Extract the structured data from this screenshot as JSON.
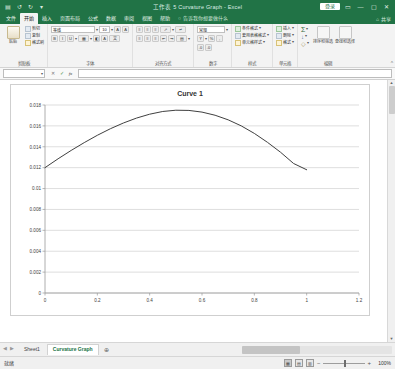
{
  "window": {
    "title": "工作表 5 Curvature Graph  -  Excel",
    "signin_label": "登录",
    "quick_access": [
      "save-icon",
      "undo-icon",
      "redo-icon",
      "customize-icon"
    ],
    "controls": {
      "ribbon_display": "▭",
      "minimize": "―",
      "maximize": "▢",
      "close": "✕"
    }
  },
  "ribbon": {
    "tabs": [
      {
        "label": "文件",
        "active": false
      },
      {
        "label": "开始",
        "active": true
      },
      {
        "label": "插入",
        "active": false
      },
      {
        "label": "页面布局",
        "active": false
      },
      {
        "label": "公式",
        "active": false
      },
      {
        "label": "数据",
        "active": false
      },
      {
        "label": "审阅",
        "active": false
      },
      {
        "label": "视图",
        "active": false
      },
      {
        "label": "帮助",
        "active": false
      }
    ],
    "tell_me": "告诉我你想要做什么",
    "share_label": "共享",
    "collapse_icon": "chevron-up-icon",
    "groups": [
      {
        "name": "剪贴板",
        "big_button": "粘贴",
        "items": [
          "剪切",
          "复制",
          "格式刷"
        ]
      },
      {
        "name": "字体",
        "font_name": "等线",
        "font_size": "10",
        "items": [
          "B",
          "I",
          "U",
          "边框",
          "填充色",
          "字体颜色",
          "拼音"
        ]
      },
      {
        "name": "对齐方式",
        "items": [
          "顶端对齐",
          "垂直居中",
          "底端对齐",
          "左对齐",
          "居中",
          "右对齐",
          "减少缩进",
          "增加缩进",
          "自动换行",
          "合并后居中"
        ]
      },
      {
        "name": "数字",
        "format": "常规",
        "items": [
          "货币",
          "百分比",
          "千位分隔",
          "增加小数位",
          "减少小数位"
        ]
      },
      {
        "name": "样式",
        "items": [
          "条件格式",
          "套用表格格式",
          "单元格样式"
        ]
      },
      {
        "name": "单元格",
        "items": [
          "插入",
          "删除",
          "格式"
        ]
      },
      {
        "name": "编辑",
        "items": [
          "自动求和",
          "填充",
          "清除",
          "排序和筛选",
          "查找和选择"
        ],
        "big_buttons": [
          "排序和筛选",
          "查找和选择"
        ]
      }
    ]
  },
  "formula_bar": {
    "name_box": "",
    "cancel_icon": "✕",
    "confirm_icon": "✓",
    "fx_icon": "fx",
    "formula_value": ""
  },
  "chart_data": {
    "type": "line",
    "title": "Curve 1",
    "xlabel": "",
    "ylabel": "",
    "xlim": [
      0,
      1.2
    ],
    "ylim": [
      0,
      0.018
    ],
    "xticks": [
      0,
      0.2,
      0.4,
      0.6,
      0.8,
      1,
      1.2
    ],
    "xticklabels": [
      "0",
      "0.2",
      "0.4",
      "0.6",
      "0.8",
      "1",
      "1.2"
    ],
    "yticks": [
      0,
      0.002,
      0.004,
      0.006,
      0.008,
      0.01,
      0.012,
      0.014,
      0.016,
      0.018
    ],
    "yticklabels": [
      "0",
      "0.002",
      "0.004",
      "0.006",
      "0.008",
      "0.01",
      "0.012",
      "0.014",
      "0.016",
      "0.018"
    ],
    "grid": "horizontal",
    "legend": "none",
    "line_color": "#404040",
    "series": [
      {
        "name": "Curve 1",
        "x": [
          0.0,
          0.05,
          0.1,
          0.15,
          0.2,
          0.25,
          0.3,
          0.35,
          0.4,
          0.45,
          0.5,
          0.55,
          0.6,
          0.65,
          0.7,
          0.75,
          0.8,
          0.85,
          0.9,
          0.95,
          1.0
        ],
        "y": [
          0.012,
          0.01285,
          0.01365,
          0.0144,
          0.0151,
          0.01573,
          0.01628,
          0.01675,
          0.01712,
          0.01738,
          0.0175,
          0.01748,
          0.01732,
          0.01702,
          0.01658,
          0.016,
          0.01528,
          0.01443,
          0.01348,
          0.0124,
          0.0118
        ]
      }
    ]
  },
  "sheet_tabs": {
    "nav_prev": "◀",
    "nav_next": "▶",
    "tabs": [
      {
        "label": "Sheet1",
        "active": false
      },
      {
        "label": "Curvature Graph",
        "active": true
      }
    ],
    "add_label": "⊕"
  },
  "status_bar": {
    "text": "就绪",
    "views": [
      "普通",
      "页面布局",
      "分页预览"
    ],
    "zoom_minus": "−",
    "zoom_plus": "+",
    "zoom_level": "100%"
  }
}
